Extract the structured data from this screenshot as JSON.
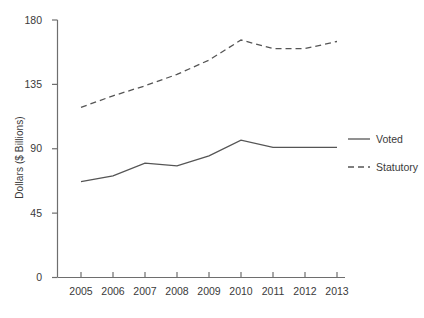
{
  "chart_data": {
    "type": "line",
    "title": "",
    "subtitle": "",
    "xlabel": "",
    "ylabel": "Dollars ($ Billions)",
    "x": [
      "2005",
      "2006",
      "2007",
      "2008",
      "2009",
      "2010",
      "2011",
      "2012",
      "2013"
    ],
    "categories": [
      "2005",
      "2006",
      "2007",
      "2008",
      "2009",
      "2010",
      "2011",
      "2012",
      "2013"
    ],
    "xtick_labels": [
      "2005",
      "2006",
      "2007",
      "2008",
      "2009",
      "2010",
      "2011",
      "2012",
      "2013"
    ],
    "ytick_labels": [
      "0",
      "45",
      "90",
      "135",
      "180"
    ],
    "yticks": [
      0,
      45,
      90,
      135,
      180
    ],
    "ylim": [
      0,
      180
    ],
    "grid": false,
    "legend_position": "right",
    "series": [
      {
        "name": "Voted",
        "style": "solid",
        "color": "#555555",
        "values": [
          67,
          71,
          80,
          78,
          85,
          96,
          91,
          91,
          91
        ]
      },
      {
        "name": "Statutory",
        "style": "dashed",
        "color": "#555555",
        "values": [
          119,
          127,
          134,
          142,
          152,
          166,
          160,
          160,
          165
        ]
      }
    ],
    "annotations": []
  },
  "legend": {
    "items": [
      {
        "label": "Voted",
        "style": "solid"
      },
      {
        "label": "Statutory",
        "style": "dashed"
      }
    ]
  },
  "colors": {
    "axis": "#6e6e6e",
    "text": "#3a3a3a",
    "line": "#555555",
    "background": "#ffffff"
  }
}
